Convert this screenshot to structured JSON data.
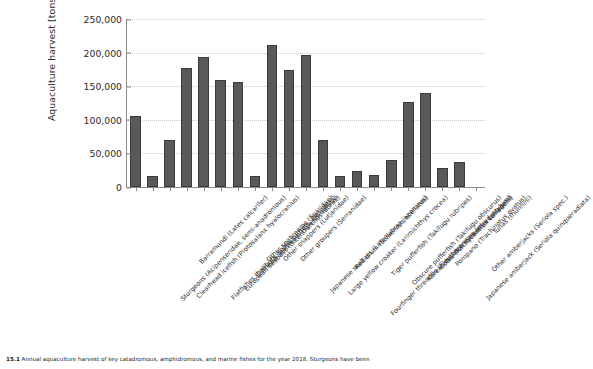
{
  "chart_data": {
    "type": "bar",
    "title": "",
    "xlabel": "",
    "ylabel": "Aquaculture harvest [tons]",
    "ylim": [
      0,
      250000
    ],
    "yticks": [
      0,
      50000,
      100000,
      150000,
      200000,
      250000
    ],
    "ytick_labels": [
      "0",
      "50,000",
      "100,000",
      "150,000",
      "200,000",
      "250,000"
    ],
    "grid": "horizontal-dotted",
    "legend": "none",
    "bar_color": "#595959",
    "bar_edge_color": "#3a3a3a",
    "categories": [
      "Sturgeons (Acipenseridae, semi-anadromous)",
      "Clearhead icefish (Protosalanx hyalocranius)",
      "Barramundi (Lates calcarifer)",
      "Flatfishes (halibuts, soles, turbots, flounders)",
      "European seabass (Dicentrarchus labrax)",
      "Gilthead seabream (Sparus aurata)",
      "Other seabreams (Sparidae)",
      "Other snappers (Lutjanidae)",
      "Other groupers (Serranidae)",
      "Japanese seabass (Lateolabrax japonicus)",
      "Large yellow croaker (Larimichthys crocea)",
      "Red drum (Sciaenops ocellatus)",
      "Fourfinger threadfin (Eleutheronema tetradactylum)",
      "Tiger pufferfish (Takifugu rubripes)",
      "Obscure pufferfish (Takifugu obscurus)",
      "Korean rockfish (Sebastes schlegelii)",
      "Cobia (Rachycentron canadum)",
      "Pompano (Trachinotus ovatus)",
      "Japanese amberjack (Seriola quinqueradiata)",
      "Other amberjacks (Seriola spec.)",
      "Tunas (thunnini)"
    ],
    "values": [
      106000,
      17000,
      70000,
      177000,
      193000,
      159000,
      156000,
      17000,
      212000,
      174000,
      196000,
      70000,
      16000,
      24000,
      18000,
      40000,
      126000,
      140000,
      29000,
      37000,
      0
    ]
  },
  "caption": {
    "number": "15.1",
    "text": "Annual aquaculture harvest of key catadromous, amphidromous, and marine fishes for the year 2018. Sturgeons have been"
  }
}
